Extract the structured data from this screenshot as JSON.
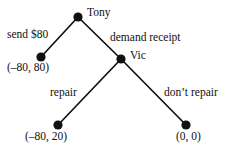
{
  "figure": {
    "type": "extensive-form-game-tree",
    "background_color": "#ffffff",
    "line_color": "#111111",
    "nodes": [
      {
        "id": "root",
        "label": "Tony",
        "kind": "decision",
        "x": 78,
        "y": 17
      },
      {
        "id": "send-end",
        "label": "",
        "kind": "terminal",
        "x": 41,
        "y": 57
      },
      {
        "id": "vic",
        "label": "Vic",
        "kind": "decision",
        "x": 121,
        "y": 59
      },
      {
        "id": "repair-end",
        "label": "",
        "kind": "terminal",
        "x": 58,
        "y": 125
      },
      {
        "id": "dont-end",
        "label": "",
        "kind": "terminal",
        "x": 186,
        "y": 125
      }
    ],
    "player_labels": {
      "root": "Tony",
      "vic": "Vic"
    },
    "actions": {
      "send": "send $80",
      "demand": "demand receipt",
      "repair": "repair",
      "dont_repair": "don’t repair"
    },
    "payoffs": {
      "send": "(–80, 80)",
      "repair": "(–80, 20)",
      "dont_repair": "(0, 0)"
    }
  }
}
